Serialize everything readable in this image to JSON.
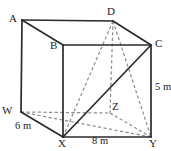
{
  "figure": {
    "type": "3d-cuboid-geometry-diagram",
    "background_color": "#ffffff",
    "solid_edge_color": "#2b2b2b",
    "hidden_edge_color": "#8c8c8c",
    "label_color": "#1d1d1d"
  },
  "vertices": [
    {
      "name": "A",
      "label": "A",
      "x": 22,
      "y": 20,
      "label_x": 9,
      "label_y": 13,
      "hidden": false
    },
    {
      "name": "B",
      "label": "B",
      "x": 63,
      "y": 45,
      "label_x": 50,
      "label_y": 40,
      "hidden": false
    },
    {
      "name": "C",
      "label": "C",
      "x": 151,
      "y": 45,
      "label_x": 155,
      "label_y": 38,
      "hidden": false
    },
    {
      "name": "D",
      "label": "D",
      "x": 113,
      "y": 21,
      "label_x": 107,
      "label_y": 6,
      "hidden": false
    },
    {
      "name": "W",
      "label": "W",
      "x": 21,
      "y": 112,
      "label_x": 2,
      "label_y": 105,
      "hidden": false
    },
    {
      "name": "X",
      "label": "X",
      "x": 63,
      "y": 137,
      "label_x": 58,
      "label_y": 138,
      "hidden": false
    },
    {
      "name": "Y",
      "label": "Y",
      "x": 151,
      "y": 137,
      "label_x": 149,
      "label_y": 138,
      "hidden": false
    },
    {
      "name": "Z",
      "label": "Z",
      "x": 110,
      "y": 113,
      "label_x": 112,
      "label_y": 101,
      "hidden": true
    }
  ],
  "solid_edges": [
    {
      "name": "edge-A-B",
      "from": "A",
      "to": "B"
    },
    {
      "name": "edge-B-C",
      "from": "B",
      "to": "C"
    },
    {
      "name": "edge-A-D",
      "from": "A",
      "to": "D"
    },
    {
      "name": "edge-D-C",
      "from": "D",
      "to": "C"
    },
    {
      "name": "edge-A-W",
      "from": "A",
      "to": "W"
    },
    {
      "name": "edge-B-X",
      "from": "B",
      "to": "X"
    },
    {
      "name": "edge-C-Y",
      "from": "C",
      "to": "Y"
    },
    {
      "name": "edge-W-X",
      "from": "W",
      "to": "X"
    },
    {
      "name": "edge-X-Y",
      "from": "X",
      "to": "Y"
    }
  ],
  "solid_diagonals": [
    {
      "name": "diagonal-X-C",
      "from": "X",
      "to": "C"
    }
  ],
  "hidden_edges": [
    {
      "name": "edge-D-Z",
      "from": "D",
      "to": "Z"
    },
    {
      "name": "edge-W-Z",
      "from": "W",
      "to": "Z"
    },
    {
      "name": "edge-Z-Y",
      "from": "Z",
      "to": "Y"
    }
  ],
  "hidden_diagonals": [
    {
      "name": "diagonal-D-X",
      "from": "D",
      "to": "X"
    },
    {
      "name": "diagonal-D-Y",
      "from": "D",
      "to": "Y"
    },
    {
      "name": "diagonal-W-Y",
      "from": "W",
      "to": "Y"
    }
  ],
  "dimensions": [
    {
      "name": "depth-label",
      "text": "6 m",
      "x": 15,
      "y": 120,
      "edge": "W-X"
    },
    {
      "name": "width-label",
      "text": "8 m",
      "x": 92,
      "y": 135,
      "edge": "X-Y"
    },
    {
      "name": "height-label",
      "text": "5 m",
      "x": 155,
      "y": 81,
      "edge": "C-Y"
    }
  ]
}
